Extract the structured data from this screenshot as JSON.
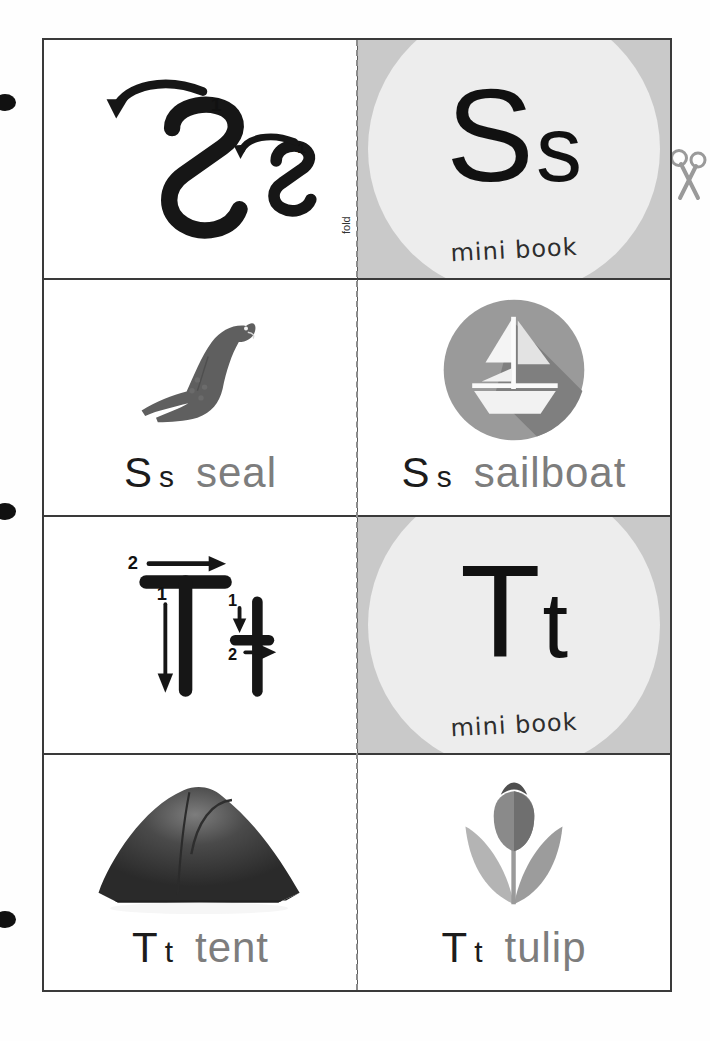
{
  "page": {
    "fold_label": "fold",
    "margin_dot_count": 3
  },
  "icons": {
    "scissors": "scissors-icon"
  },
  "colors": {
    "cover_background": "#c9c9c9",
    "cover_circle": "#ededed",
    "letter_black": "#111111",
    "word_gray": "#7d7d7d",
    "border": "#3a3a3a",
    "fold_dash": "#8d8d8d",
    "seal_gray": "#5f5f5f",
    "sailboat_circle": "#9a9a9a",
    "tent_dark": "#3a3a3a",
    "tulip_gray": "#8a8a8a"
  },
  "cards": [
    {
      "id": "ss-tracing",
      "type": "tracing",
      "row": 1,
      "column": "left",
      "letter_upper": "S",
      "letter_lower": "s",
      "stroke_numbers": [
        "1",
        "1"
      ],
      "stroke_count": 2
    },
    {
      "id": "ss-cover",
      "type": "cover",
      "row": 1,
      "column": "right",
      "letter_upper": "S",
      "letter_lower": "s",
      "subtitle": "mini book"
    },
    {
      "id": "ss-seal",
      "type": "picture",
      "row": 2,
      "column": "left",
      "letter_upper": "S",
      "letter_lower": "s",
      "word": "seal",
      "image": "seal-illustration"
    },
    {
      "id": "ss-sailboat",
      "type": "picture",
      "row": 2,
      "column": "right",
      "letter_upper": "S",
      "letter_lower": "s",
      "word": "sailboat",
      "image": "sailboat-flat-icon"
    },
    {
      "id": "tt-tracing",
      "type": "tracing",
      "row": 3,
      "column": "left",
      "letter_upper": "T",
      "letter_lower": "t",
      "stroke_numbers": [
        "1",
        "2",
        "1",
        "2"
      ],
      "stroke_count": 4
    },
    {
      "id": "tt-cover",
      "type": "cover",
      "row": 3,
      "column": "right",
      "letter_upper": "T",
      "letter_lower": "t",
      "subtitle": "mini book"
    },
    {
      "id": "tt-tent",
      "type": "picture",
      "row": 4,
      "column": "left",
      "letter_upper": "T",
      "letter_lower": "t",
      "word": "tent",
      "image": "tent-photo"
    },
    {
      "id": "tt-tulip",
      "type": "picture",
      "row": 4,
      "column": "right",
      "letter_upper": "T",
      "letter_lower": "t",
      "word": "tulip",
      "image": "tulip-illustration"
    }
  ]
}
